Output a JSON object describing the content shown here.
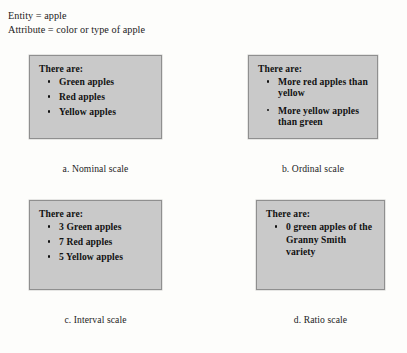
{
  "figure": {
    "header": {
      "entity_line": "Entity = apple",
      "attribute_line": "Attribute = color or type of apple"
    },
    "colors": {
      "panel_fill": "#c9c9c9",
      "panel_border": "#8f8f8f",
      "page_background": "#fdfdfb",
      "text": "#111111"
    },
    "panels": [
      {
        "id": "nominal",
        "lead": "There are:",
        "bullets": [
          "Green apples",
          "Red apples",
          "Yellow apples"
        ],
        "caption": "a. Nominal scale"
      },
      {
        "id": "ordinal",
        "lead": "There are:",
        "bullets": [
          "More red apples than yellow",
          "More yellow apples than green"
        ],
        "caption": "b. Ordinal scale"
      },
      {
        "id": "interval",
        "lead": "There are:",
        "bullets": [
          "3 Green apples",
          "7 Red apples",
          "5 Yellow apples"
        ],
        "caption": "c. Interval scale"
      },
      {
        "id": "ratio",
        "lead": "There are:",
        "bullets": [
          "0 green apples of the Granny Smith variety"
        ],
        "caption": "d. Ratio scale"
      }
    ]
  }
}
